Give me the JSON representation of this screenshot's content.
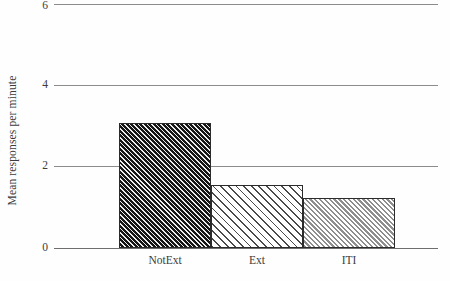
{
  "chart_data": {
    "type": "bar",
    "title": "",
    "xlabel": "",
    "ylabel": "Mean responses per minute",
    "categories": [
      "NotExt",
      "Ext",
      "ITI"
    ],
    "values": [
      3.07,
      1.56,
      1.24
    ],
    "ylim": [
      0,
      6
    ],
    "yticks": [
      "0",
      "2",
      "4",
      "6"
    ],
    "ytick_values": [
      0,
      2,
      4,
      6
    ],
    "grid": "horizontal",
    "legend": "none",
    "series": [
      {
        "name": "Mean responses per minute",
        "values": [
          3.07,
          1.56,
          1.24
        ],
        "bar_styles": [
          "dark-diagonal-hatch",
          "light-diagonal-hatch",
          "gray-diagonal-hatch"
        ]
      }
    ],
    "colors": {
      "bar_dark": "#161616",
      "bar_hatch_light": "#4a4a4a",
      "bar_hatch_gray": "#8e8e8e",
      "gridline": "#8c8c8c",
      "axis": "#6e6e6e",
      "text": "#3c3c3c",
      "background": "#fefefe"
    }
  }
}
